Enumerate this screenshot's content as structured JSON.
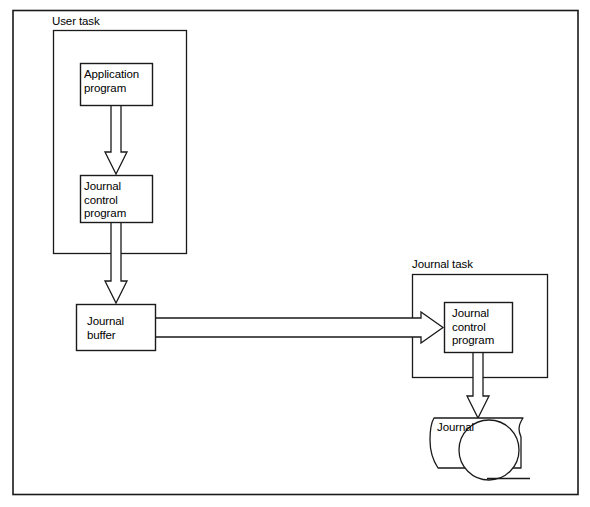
{
  "diagram": {
    "stroke_color": "#1a1a1a",
    "fill_color": "#ffffff",
    "groups": [
      {
        "id": "user-task",
        "label": "User task"
      },
      {
        "id": "journal-task",
        "label": "Journal task"
      }
    ],
    "nodes": [
      {
        "id": "application-program",
        "label": "Application\nprogram"
      },
      {
        "id": "journal-control-program-user",
        "label": "Journal\ncontrol\nprogram"
      },
      {
        "id": "journal-buffer",
        "label": "Journal\nbuffer"
      },
      {
        "id": "journal-control-program-task",
        "label": "Journal\ncontrol\nprogram"
      },
      {
        "id": "journal-store",
        "label": "Journal"
      }
    ],
    "edges": [
      {
        "id": "app-to-jcp",
        "from": "application-program",
        "to": "journal-control-program-user",
        "direction": "down"
      },
      {
        "id": "jcp-to-buffer",
        "from": "journal-control-program-user",
        "to": "journal-buffer",
        "direction": "down"
      },
      {
        "id": "buffer-to-jcp-task",
        "from": "journal-buffer",
        "to": "journal-control-program-task",
        "direction": "right"
      },
      {
        "id": "jcp-task-to-journal",
        "from": "journal-control-program-task",
        "to": "journal-store",
        "direction": "down"
      }
    ]
  }
}
